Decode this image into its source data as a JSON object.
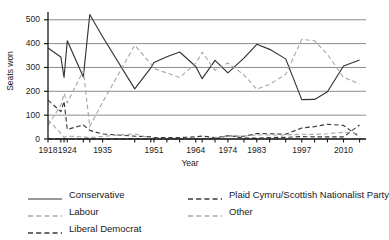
{
  "chart_data": {
    "type": "line",
    "title": "",
    "xlabel": "Year",
    "ylabel": "Seats won",
    "ylim": [
      0,
      520
    ],
    "yticks": [
      0,
      100,
      200,
      300,
      400,
      500
    ],
    "xlim": [
      1918,
      2017
    ],
    "xtick_labels": [
      "1918",
      "1924",
      "1935",
      "1951",
      "1964",
      "1974",
      "1983",
      "1997",
      "2010"
    ],
    "xtick_values": [
      1918,
      1924,
      1935,
      1951,
      1964,
      1974,
      1983,
      1997,
      2010
    ],
    "grid": "horizontal",
    "legend_position": "below",
    "x": [
      1918,
      1922,
      1923,
      1924,
      1929,
      1931,
      1935,
      1945,
      1950,
      1951,
      1955,
      1959,
      1964,
      1966,
      1970,
      1974,
      1979,
      1983,
      1987,
      1992,
      1997,
      2001,
      2005,
      2010,
      2015
    ],
    "series": [
      {
        "name": "Conservative",
        "style": "solid",
        "color": "#333333",
        "values": [
          382,
          344,
          258,
          412,
          260,
          522,
          429,
          210,
          298,
          321,
          345,
          365,
          304,
          253,
          330,
          277,
          339,
          397,
          376,
          336,
          165,
          166,
          198,
          306,
          331
        ]
      },
      {
        "name": "Labour",
        "style": "dashed",
        "color": "#a8a8a8",
        "values": [
          57,
          142,
          191,
          151,
          287,
          52,
          154,
          393,
          315,
          295,
          277,
          258,
          317,
          364,
          288,
          319,
          269,
          209,
          229,
          271,
          418,
          412,
          355,
          258,
          232
        ]
      },
      {
        "name": "Liberal Democrat",
        "style": "dashed",
        "color": "#3a3a3a",
        "values": [
          163,
          115,
          158,
          40,
          59,
          36,
          21,
          12,
          9,
          6,
          6,
          6,
          9,
          12,
          6,
          13,
          11,
          23,
          22,
          20,
          46,
          52,
          62,
          57,
          8
        ]
      },
      {
        "name": "Plaid Cymru/Scottish Nationalist Party",
        "style": "dashed",
        "color": "#3a3a3a",
        "values": [
          0,
          0,
          0,
          0,
          0,
          0,
          0,
          0,
          0,
          0,
          0,
          0,
          0,
          1,
          1,
          14,
          4,
          4,
          6,
          7,
          10,
          9,
          9,
          9,
          59
        ]
      },
      {
        "name": "Other",
        "style": "dashed",
        "color": "#a8a8a8",
        "values": [
          80,
          24,
          7,
          12,
          9,
          5,
          11,
          22,
          3,
          3,
          2,
          1,
          0,
          2,
          5,
          11,
          12,
          17,
          17,
          17,
          20,
          19,
          22,
          28,
          22
        ]
      }
    ]
  },
  "legend": {
    "left_column": [
      {
        "label": "Conservative",
        "style": "solid",
        "color": "#333333"
      },
      {
        "label": "Labour",
        "style": "dashed",
        "color": "#a8a8a8"
      },
      {
        "label": "Liberal Democrat",
        "style": "dashed",
        "color": "#3a3a3a"
      }
    ],
    "right_column": [
      {
        "label": "Plaid Cymru/Scottish Nationalist Party",
        "style": "dashed",
        "color": "#3a3a3a"
      },
      {
        "label": "Other",
        "style": "dashed",
        "color": "#a8a8a8"
      }
    ]
  },
  "colors": {
    "gridline": "#8c8c8c",
    "axis": "#1a1a1a",
    "background": "#ffffff",
    "text": "#1a1a1a"
  }
}
